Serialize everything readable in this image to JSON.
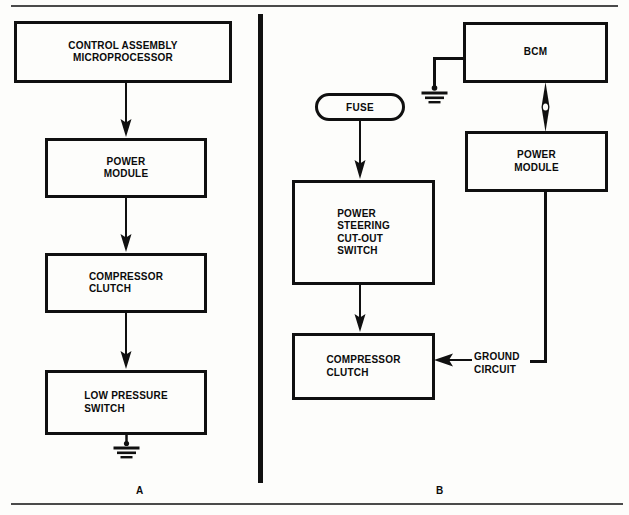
{
  "figure": {
    "background_color": "#fdfdfb",
    "line_color": "#101010",
    "rule_color": "#4a4a4a"
  },
  "panel_a": {
    "letter": "A",
    "boxes": {
      "control_assembly": "CONTROL ASSEMBLY\nMICROPROCESSOR",
      "power_module": "POWER\nMODULE",
      "compressor_clutch": "COMPRESSOR\nCLUTCH",
      "low_pressure_switch": "LOW PRESSURE\nSWITCH"
    },
    "icons": {
      "ground": "ground-symbol"
    }
  },
  "panel_b": {
    "letter": "B",
    "boxes": {
      "fuse": "FUSE",
      "bcm": "BCM",
      "power_module": "POWER\nMODULE",
      "power_steering_cutout_switch": "POWER\nSTEERING\nCUT-OUT\nSWITCH",
      "compressor_clutch": "COMPRESSOR\nCLUTCH"
    },
    "labels": {
      "ground_circuit": "GROUND\nCIRCUIT"
    },
    "icons": {
      "ground": "ground-symbol",
      "bidirectional_link": "double-arrow-icon"
    }
  }
}
